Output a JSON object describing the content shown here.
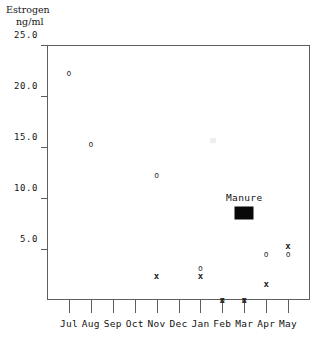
{
  "chart_data": {
    "type": "scatter",
    "title": "",
    "ylabel_lines": [
      "Estrogen",
      "ng/ml"
    ],
    "ylabel": "Estrogen ng/ml",
    "xlabel": "",
    "ylim": [
      0,
      25.0
    ],
    "ytick_values": [
      25.0,
      20.0,
      15.0,
      10.0,
      5.0
    ],
    "ytick_labels": [
      "25.0",
      "20.0",
      "15.0",
      "10.0",
      "5.0"
    ],
    "categories": [
      "Jul",
      "Aug",
      "Sep",
      "Oct",
      "Nov",
      "Dec",
      "Jan",
      "Feb",
      "Mar",
      "Apr",
      "May"
    ],
    "grid": false,
    "legend_position": "none",
    "series": [
      {
        "name": "open-circle",
        "marker": "o",
        "points": [
          {
            "x": "Jul",
            "x_index": 0,
            "y": 22.3
          },
          {
            "x": "Aug",
            "x_index": 1,
            "y": 15.3
          },
          {
            "x": "Nov",
            "x_index": 4,
            "y": 12.3
          },
          {
            "x": "Jan",
            "x_index": 6,
            "y": 3.1
          },
          {
            "x": "Feb",
            "x_index": 7,
            "y": 0.0
          },
          {
            "x": "Mar",
            "x_index": 8,
            "y": 0.0
          },
          {
            "x": "Apr",
            "x_index": 9,
            "y": 4.5
          },
          {
            "x": "May",
            "x_index": 10,
            "y": 4.5
          }
        ]
      },
      {
        "name": "cross",
        "marker": "x",
        "points": [
          {
            "x": "Nov",
            "x_index": 4,
            "y": 2.4
          },
          {
            "x": "Jan",
            "x_index": 6,
            "y": 2.4
          },
          {
            "x": "Feb",
            "x_index": 7,
            "y": 0.0
          },
          {
            "x": "Mar",
            "x_index": 8,
            "y": 0.0
          },
          {
            "x": "Apr",
            "x_index": 9,
            "y": 1.6
          },
          {
            "x": "May",
            "x_index": 10,
            "y": 5.3
          }
        ]
      }
    ],
    "annotations": [
      {
        "label": "Manure",
        "x": "Mar",
        "x_index": 8,
        "y": 10.0,
        "swatch": {
          "y": 8.5,
          "color": "#080808",
          "width_px": 19,
          "height_px": 13
        }
      }
    ],
    "colors": {
      "background": "#ffffff",
      "axis": "#5d5d5d",
      "text": "#141414",
      "marker": "#2b2b2b",
      "swatch": "#080808"
    }
  }
}
